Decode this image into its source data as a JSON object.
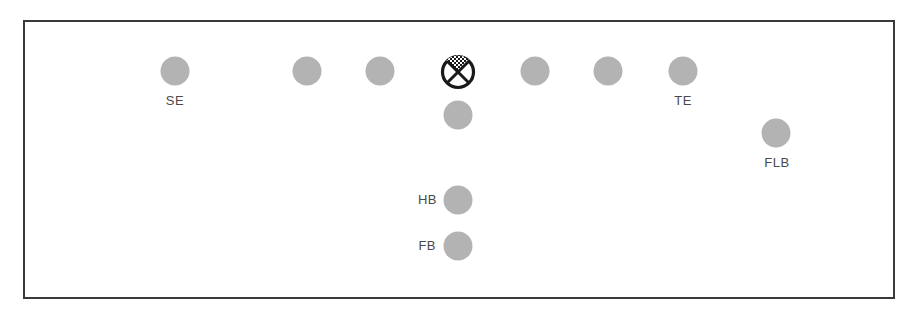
{
  "diagram": {
    "type": "football-formation",
    "colors": {
      "player_fill": "#b3b3b3",
      "center_stroke": "#1a1a1a",
      "frame": "#3a3a3a",
      "label": "#4a4a4a"
    },
    "center": {
      "x": 458,
      "y": 72,
      "r": 16,
      "symbol": "circle-x-checkered-icon"
    },
    "players": [
      {
        "id": "se",
        "x": 175,
        "y": 71,
        "label": "SE",
        "label_pos": "below"
      },
      {
        "id": "lt",
        "x": 307,
        "y": 71,
        "label": "",
        "label_pos": "none"
      },
      {
        "id": "lg",
        "x": 380,
        "y": 71,
        "label": "",
        "label_pos": "none"
      },
      {
        "id": "rg",
        "x": 535,
        "y": 71,
        "label": "",
        "label_pos": "none"
      },
      {
        "id": "rt",
        "x": 608,
        "y": 71,
        "label": "",
        "label_pos": "none"
      },
      {
        "id": "te",
        "x": 683,
        "y": 71,
        "label": "TE",
        "label_pos": "below"
      },
      {
        "id": "qb",
        "x": 458,
        "y": 115,
        "label": "",
        "label_pos": "none"
      },
      {
        "id": "flb",
        "x": 776,
        "y": 133,
        "label": "FLB",
        "label_pos": "below"
      },
      {
        "id": "hb",
        "x": 458,
        "y": 200,
        "label": "HB",
        "label_pos": "left"
      },
      {
        "id": "fb",
        "x": 458,
        "y": 246,
        "label": "FB",
        "label_pos": "left"
      }
    ],
    "labels": {
      "se": "SE",
      "te": "TE",
      "flb": "FLB",
      "hb": "HB",
      "fb": "FB"
    }
  }
}
